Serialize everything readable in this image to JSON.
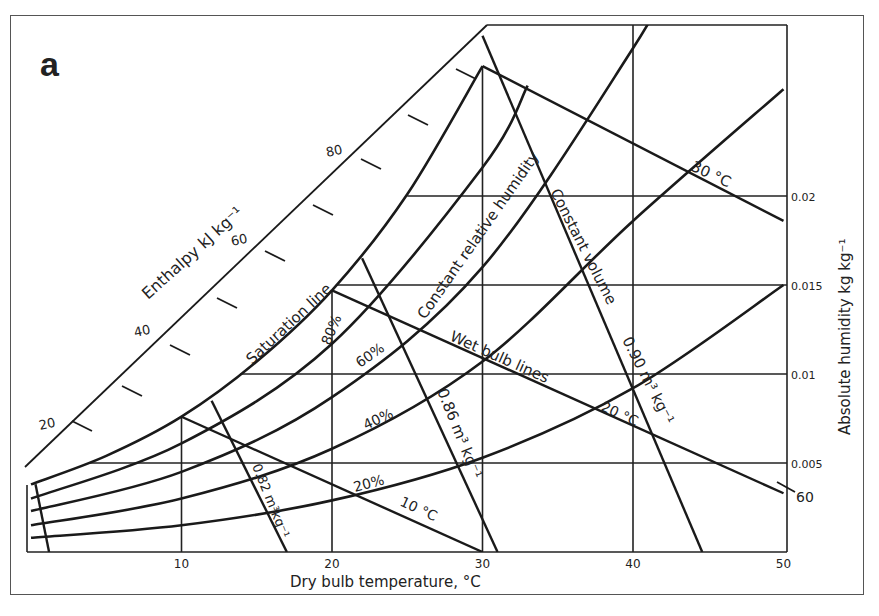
{
  "panel_label": "a",
  "chart_data": {
    "type": "line",
    "xlabel": "Dry bulb temperature,  °C",
    "ylabel": "Absolute humidity kg kg⁻¹",
    "enthalpy_label": "Enthalpy kJ kg⁻¹",
    "xlim": [
      0,
      50
    ],
    "ylim": [
      0,
      0.03
    ],
    "x_ticks": [
      10,
      20,
      30,
      40,
      50
    ],
    "x_tick_labels": [
      "10",
      "20",
      "30",
      "40",
      "50"
    ],
    "y_ticks": [
      0.005,
      0.01,
      0.015,
      0.02
    ],
    "y_tick_labels": [
      "0.005",
      "0.01",
      "0.015",
      "0.02"
    ],
    "enthalpy_ticks": [
      20,
      40,
      60,
      80
    ],
    "enthalpy_tick_labels": [
      "20",
      "40",
      "60",
      "80"
    ],
    "enthalpy_right_label": "60",
    "grid": true,
    "series": [
      {
        "name": "Saturation line (100%)",
        "x": [
          0,
          5,
          10,
          15,
          20,
          25,
          30
        ],
        "y": [
          0.0038,
          0.0054,
          0.0076,
          0.0107,
          0.0147,
          0.0201,
          0.0273
        ]
      },
      {
        "name": "80%",
        "x": [
          0,
          10,
          20,
          30,
          33
        ],
        "y": [
          0.003,
          0.0061,
          0.0117,
          0.0216,
          0.0262
        ]
      },
      {
        "name": "60%",
        "x": [
          0,
          10,
          20,
          30,
          40,
          43
        ],
        "y": [
          0.0023,
          0.0045,
          0.0087,
          0.016,
          0.0283,
          0.033
        ]
      },
      {
        "name": "40%",
        "x": [
          0,
          10,
          20,
          30,
          40,
          50
        ],
        "y": [
          0.0015,
          0.003,
          0.0058,
          0.0107,
          0.0186,
          0.026
        ]
      },
      {
        "name": "20%",
        "x": [
          0,
          10,
          20,
          30,
          40,
          50
        ],
        "y": [
          0.0008,
          0.0015,
          0.0029,
          0.0053,
          0.0092,
          0.015
        ]
      }
    ],
    "wet_bulb_lines": [
      {
        "label": "10 °C",
        "from": [
          10,
          0.0076
        ],
        "to": [
          30,
          0.0
        ]
      },
      {
        "label": "20 °C",
        "from": [
          20,
          0.0147
        ],
        "to": [
          50,
          0.0033
        ]
      },
      {
        "label": "30 °C",
        "from": [
          30,
          0.0273
        ],
        "to": [
          50,
          0.0186
        ]
      }
    ],
    "constant_volume_lines": [
      {
        "label": "0.82 m³ kg⁻¹",
        "from": [
          12,
          0.0085
        ],
        "to": [
          17,
          0.0
        ]
      },
      {
        "label": "0.86 m³ kg⁻¹",
        "from": [
          22,
          0.0165
        ],
        "to": [
          31,
          0.0
        ]
      },
      {
        "label": "0.90 m³ kg⁻¹",
        "from": [
          30,
          0.029
        ],
        "to": [
          44.6,
          0.0
        ]
      }
    ],
    "annotations": [
      "Saturation line",
      "Constant relative humidity",
      "Constant volume",
      "Wet bulb lines",
      "80%",
      "60%",
      "40%",
      "20%",
      "10 °C",
      "20 °C",
      "30 °C",
      "0.82 m³kg⁻¹",
      "0.86 m³ kg⁻¹",
      "0.90 m³ kg⁻¹"
    ]
  }
}
